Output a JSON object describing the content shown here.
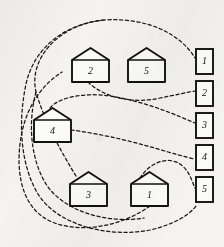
{
  "diagram": {
    "title": "",
    "background_color": "#f4f3f1",
    "stroke_color": "#141414",
    "link_style": "dashed",
    "houses": [
      {
        "id": "house-2",
        "label": "2",
        "x": 72,
        "y": 48,
        "w": 37,
        "h": 34,
        "roof_h": 12
      },
      {
        "id": "house-5",
        "label": "5",
        "x": 128,
        "y": 48,
        "w": 37,
        "h": 34,
        "roof_h": 12
      },
      {
        "id": "house-4",
        "label": "4",
        "x": 34,
        "y": 108,
        "w": 37,
        "h": 34,
        "roof_h": 12
      },
      {
        "id": "house-3",
        "label": "3",
        "x": 70,
        "y": 172,
        "w": 37,
        "h": 34,
        "roof_h": 12
      },
      {
        "id": "house-1",
        "label": "1",
        "x": 131,
        "y": 172,
        "w": 37,
        "h": 34,
        "roof_h": 12
      }
    ],
    "boxes": [
      {
        "id": "box-1",
        "label": "1",
        "x": 196,
        "y": 49,
        "w": 17,
        "h": 25
      },
      {
        "id": "box-2",
        "label": "2",
        "x": 196,
        "y": 81,
        "w": 17,
        "h": 25
      },
      {
        "id": "box-3",
        "label": "3",
        "x": 196,
        "y": 113,
        "w": 17,
        "h": 25
      },
      {
        "id": "box-4",
        "label": "4",
        "x": 196,
        "y": 145,
        "w": 17,
        "h": 25
      },
      {
        "id": "box-5",
        "label": "5",
        "x": 196,
        "y": 177,
        "w": 17,
        "h": 25
      }
    ],
    "links": [
      {
        "id": "link-house3-box1",
        "from": "house-3",
        "to": "box-1",
        "path": "M 76 176 C 60 150 44 120 36 92 C 28 58 60 24 104 20 C 150 17 182 36 195 58"
      },
      {
        "id": "link-house2-box2",
        "from": "house-2",
        "to": "box-2",
        "path": "M 88 82 C 104 98 134 104 160 98 C 176 95 188 92 195 91"
      },
      {
        "id": "link-house4-box3",
        "from": "house-4",
        "to": "box-3",
        "path": "M 50 108 C 58 98 82 92 110 96 C 148 102 178 116 195 123"
      },
      {
        "id": "link-house4-box4",
        "from": "house-4",
        "to": "box-4",
        "path": "M 71 130 C 104 134 142 144 168 152 C 182 156 190 158 195 159"
      },
      {
        "id": "link-house1-box5",
        "from": "house-1",
        "to": "box-5",
        "path": "M 140 178 C 150 162 168 156 180 164 C 190 171 192 182 195 188"
      },
      {
        "id": "link-house1-left-outer",
        "from": "house-1",
        "to": "house-4",
        "path": "M 150 206 C 122 226 82 234 52 222 C 24 210 16 178 20 144 C 24 110 40 86 62 72"
      },
      {
        "id": "link-outer-sweep-a",
        "path": "M 104 20 C 64 24 34 48 26 84 C 18 122 20 164 38 194 C 58 226 110 238 150 230 C 176 224 190 214 196 206"
      },
      {
        "id": "link-outer-sweep-b",
        "path": "M 36 92 C 28 122 30 158 46 184 C 64 212 108 224 144 218"
      }
    ]
  }
}
